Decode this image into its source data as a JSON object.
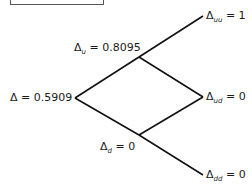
{
  "diagram": {
    "type": "binomial-tree",
    "nodes": {
      "root": {
        "symbol": "Δ",
        "sub": "",
        "eq": " = 0.5909"
      },
      "u": {
        "symbol": "Δ",
        "sub": "u",
        "eq": " = 0.8095"
      },
      "d": {
        "symbol": "Δ",
        "sub": "d",
        "eq": " = 0"
      },
      "uu": {
        "symbol": "Δ",
        "sub": "uu",
        "eq": " = 1"
      },
      "ud": {
        "symbol": "Δ",
        "sub": "ud",
        "eq": " = 0"
      },
      "dd": {
        "symbol": "Δ",
        "sub": "dd",
        "eq": " = 0"
      }
    },
    "line_color": "#111111"
  }
}
